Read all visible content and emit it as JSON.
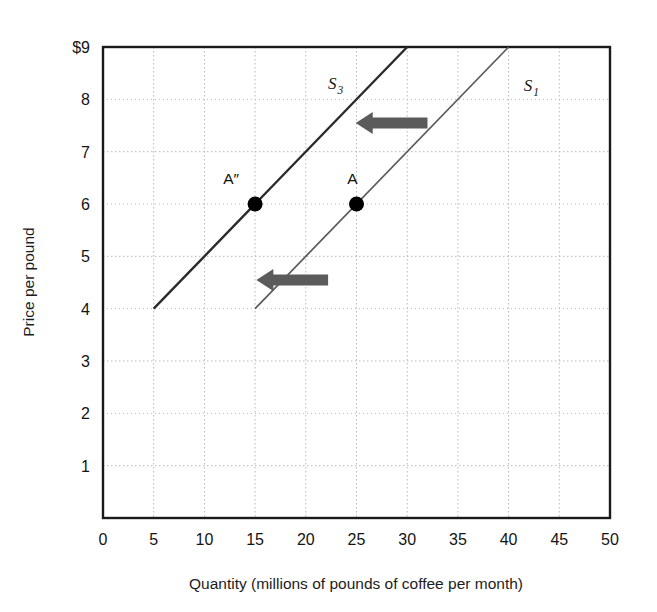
{
  "chart_data": {
    "type": "line",
    "title": "",
    "xlabel": "Quantity (millions of pounds of coffee per month)",
    "ylabel": "Price per pound",
    "xlim": [
      0,
      50
    ],
    "ylim": [
      0,
      9
    ],
    "grid": true,
    "legend_position": "inline-labels",
    "x_ticks": [
      "0",
      "5",
      "10",
      "15",
      "20",
      "25",
      "30",
      "35",
      "40",
      "45",
      "50"
    ],
    "x_tick_values": [
      0,
      5,
      10,
      15,
      20,
      25,
      30,
      35,
      40,
      45,
      50
    ],
    "y_ticks": [
      "",
      "1",
      "2",
      "3",
      "4",
      "5",
      "6",
      "7",
      "8",
      "$9"
    ],
    "y_tick_values": [
      0,
      1,
      2,
      3,
      4,
      5,
      6,
      7,
      8,
      9
    ],
    "series": [
      {
        "name": "S1",
        "label": "S",
        "subscript": "1",
        "label_x": 41.5,
        "label_y": 8.15,
        "color": "#5a5a5a",
        "width": 1.7,
        "points": [
          {
            "x": 15,
            "y": 4
          },
          {
            "x": 40,
            "y": 9
          }
        ]
      },
      {
        "name": "S3",
        "label": "S",
        "subscript": "3",
        "label_x": 22.2,
        "label_y": 8.2,
        "color": "#2a2a2a",
        "width": 2.4,
        "points": [
          {
            "x": 5,
            "y": 4
          },
          {
            "x": 30,
            "y": 9
          }
        ]
      }
    ],
    "points": [
      {
        "name": "A",
        "label": "A",
        "x": 25,
        "y": 6,
        "label_dx": -4,
        "label_dy": -20
      },
      {
        "name": "A-double-prime",
        "label": "A″",
        "x": 15,
        "y": 6,
        "label_dx": -24,
        "label_dy": -20
      }
    ],
    "annotations": [
      {
        "name": "shift-arrow-upper",
        "type": "arrow",
        "direction": "left",
        "from_x": 32.0,
        "from_y": 7.55,
        "to_x": 26.6,
        "to_y": 7.55
      },
      {
        "name": "shift-arrow-lower",
        "type": "arrow",
        "direction": "left",
        "from_x": 22.2,
        "from_y": 4.55,
        "to_x": 16.8,
        "to_y": 4.55
      }
    ]
  },
  "colors": {
    "background": "#ffffff",
    "axis": "#1a1a1a",
    "grid": "#b8b8b8",
    "arrow": "#5b5b5b",
    "marker": "#000000",
    "curve_s1": "#5a5a5a",
    "curve_s3": "#2a2a2a"
  }
}
